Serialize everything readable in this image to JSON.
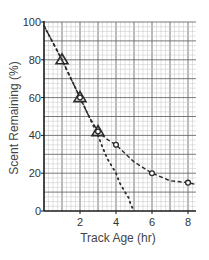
{
  "chart_data": {
    "type": "line",
    "title": "",
    "xlabel": "Track Age (hr)",
    "ylabel": "Scent Remaining (%)",
    "xlim": [
      0,
      8.45
    ],
    "ylim": [
      0,
      100
    ],
    "x_ticks": [
      2,
      4,
      6,
      8
    ],
    "x_tick_labels": [
      "2",
      "4",
      "6",
      "8"
    ],
    "y_ticks": [
      0,
      20,
      40,
      60,
      80,
      100
    ],
    "y_tick_labels": [
      "0",
      "20",
      "40",
      "60",
      "80",
      "100"
    ],
    "grid": true,
    "legend": null,
    "series": [
      {
        "name": "dashed-curve",
        "style": "dashed",
        "x": [
          0,
          0.5,
          1,
          1.5,
          2,
          2.5,
          3,
          3.5,
          4,
          5,
          6,
          7,
          8,
          8.45
        ],
        "values": [
          98,
          89,
          80,
          70,
          60,
          50,
          42,
          38,
          35,
          26,
          20,
          16,
          15,
          14
        ]
      },
      {
        "name": "dotted-line",
        "style": "dotted",
        "x": [
          0,
          1,
          2,
          3,
          3.2,
          3.5,
          4,
          4.2,
          4.5,
          4.7,
          4.8,
          5
        ],
        "values": [
          98,
          80,
          60,
          40,
          35,
          28,
          20,
          15,
          10,
          7,
          4,
          0
        ]
      },
      {
        "name": "triangle-markers",
        "marker": "triangle",
        "x": [
          1,
          2,
          3
        ],
        "values": [
          80,
          60,
          42
        ]
      },
      {
        "name": "circle-markers",
        "marker": "circle",
        "x": [
          2,
          3,
          4,
          6,
          8
        ],
        "values": [
          60,
          42,
          35,
          20,
          15
        ]
      }
    ]
  },
  "plot": {
    "left": 44,
    "top": 22,
    "right": 196,
    "bottom": 211,
    "px_per_hr": 18,
    "px_per_pct": 1.89
  },
  "colors": {
    "axis": "#1a1a1a",
    "grid_major": "#6a6a6a",
    "grid_minor": "#c4c4c4",
    "series": "#2a2a2a"
  }
}
